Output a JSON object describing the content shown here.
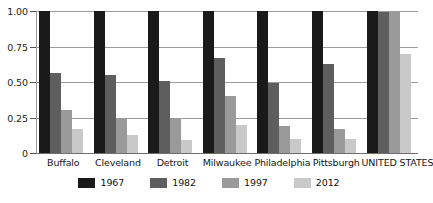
{
  "chart_data": {
    "type": "bar",
    "title": "",
    "subtitle": "",
    "xlabel": "",
    "ylabel": "",
    "ylim": [
      0,
      1.0
    ],
    "grid": true,
    "legend_position": "bottom",
    "y_ticks": [
      "1.00",
      "0.75",
      "0.50",
      "0.25",
      "0"
    ],
    "y_tick_values": [
      1.0,
      0.75,
      0.5,
      0.25,
      0
    ],
    "categories": [
      "Buffalo",
      "Cleveland",
      "Detroit",
      "Milwaukee",
      "Philadelphia",
      "Pittsburgh",
      "UNITED STATES"
    ],
    "series": [
      {
        "name": "1967",
        "color": "#1a1a1a",
        "values": [
          1.0,
          1.0,
          1.0,
          1.0,
          1.0,
          1.0,
          1.0
        ]
      },
      {
        "name": "1982",
        "color": "#5e5e5e",
        "values": [
          0.56,
          0.55,
          0.51,
          0.67,
          0.49,
          0.63,
          0.99
        ]
      },
      {
        "name": "1997",
        "color": "#9a9a9a",
        "values": [
          0.3,
          0.25,
          0.24,
          0.4,
          0.19,
          0.17,
          0.99
        ]
      },
      {
        "name": "2012",
        "color": "#c9c9c9",
        "values": [
          0.17,
          0.13,
          0.09,
          0.2,
          0.1,
          0.1,
          0.7
        ]
      }
    ]
  },
  "legend": {
    "items": [
      {
        "label": "1967",
        "color": "#1a1a1a"
      },
      {
        "label": "1982",
        "color": "#5e5e5e"
      },
      {
        "label": "1997",
        "color": "#9a9a9a"
      },
      {
        "label": "2012",
        "color": "#c9c9c9"
      }
    ]
  },
  "colors": {
    "gridline": "#9b9b9b",
    "baseline": "#6e6e6e",
    "text": "#161616",
    "background": "#ffffff"
  }
}
